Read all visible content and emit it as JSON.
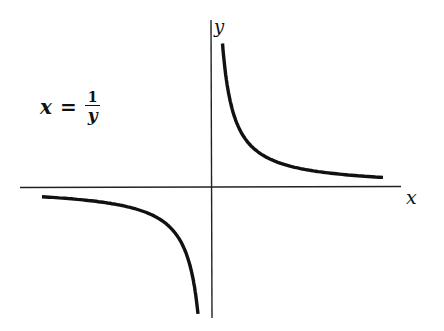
{
  "chart_data": {
    "type": "line",
    "title": "",
    "equation": {
      "lhs": "x",
      "equals": "=",
      "numerator": "1",
      "denominator": "y",
      "text": "x = 1/y"
    },
    "xlabel": "x",
    "ylabel": "y",
    "grid": false,
    "legend": null,
    "ticks": {
      "x": [],
      "y": []
    },
    "axis_origin_px": [
      211,
      187
    ],
    "series": [
      {
        "name": "upper branch (x>0, y>0)",
        "x": [
          0.07,
          0.1,
          0.15,
          0.25,
          0.5,
          1,
          2,
          4,
          7
        ],
        "y": [
          14.3,
          10,
          6.67,
          4,
          2,
          1,
          0.5,
          0.25,
          0.14
        ]
      },
      {
        "name": "lower branch (x<0, y<0)",
        "x": [
          -7,
          -4,
          -2,
          -1,
          -0.5,
          -0.25,
          -0.15,
          -0.1,
          -0.08
        ],
        "y": [
          -0.14,
          -0.25,
          -0.5,
          -1,
          -2,
          -4,
          -6.67,
          -10,
          -12.5
        ]
      }
    ]
  },
  "labels": {
    "x": "x",
    "y": "y"
  },
  "colors": {
    "curve": "#111111",
    "axis": "#222222",
    "background": "#ffffff"
  }
}
